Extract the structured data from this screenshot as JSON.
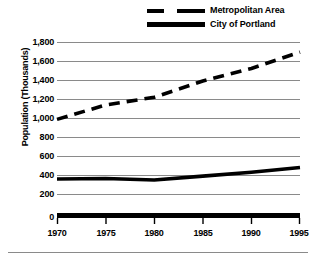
{
  "chart_data": {
    "type": "line",
    "title": "",
    "xlabel": "",
    "ylabel": "Population (Thousands)",
    "x": [
      1970,
      1975,
      1980,
      1985,
      1990,
      1995
    ],
    "xlim": [
      1970,
      1995
    ],
    "ylim": [
      0,
      1800
    ],
    "ytick_labels": [
      "1,800",
      "1,600",
      "1,400",
      "1,200",
      "1,000",
      "800",
      "600",
      "400",
      "200",
      "0"
    ],
    "ytick_values": [
      1800,
      1600,
      1400,
      1200,
      1000,
      800,
      600,
      400,
      200,
      0
    ],
    "xtick_labels": [
      "1970",
      "1975",
      "1980",
      "1985",
      "1990",
      "1995"
    ],
    "grid": true,
    "legend_position": "top-right",
    "series": [
      {
        "name": "Metropolitan Area",
        "style": "dashed",
        "color": "#000000",
        "values": [
          1000,
          1150,
          1230,
          1400,
          1530,
          1700
        ]
      },
      {
        "name": "City of Portland",
        "style": "solid",
        "color": "#000000",
        "values": [
          380,
          385,
          370,
          410,
          450,
          500
        ]
      }
    ]
  },
  "legend": {
    "items": [
      {
        "label": "Metropolitan Area",
        "style": "dashed"
      },
      {
        "label": "City of Portland",
        "style": "solid"
      }
    ]
  },
  "axes": {
    "y_title": "Population (Thousands)",
    "y_labels": [
      "1,800",
      "1,600",
      "1,400",
      "1,200",
      "1,000",
      "800",
      "600",
      "400",
      "200",
      "0"
    ],
    "x_labels": [
      "1970",
      "1975",
      "1980",
      "1985",
      "1990",
      "1995"
    ]
  },
  "colors": {
    "line": "#000000",
    "grid": "#8a8a8a",
    "axis": "#000000",
    "background": "#ffffff"
  }
}
